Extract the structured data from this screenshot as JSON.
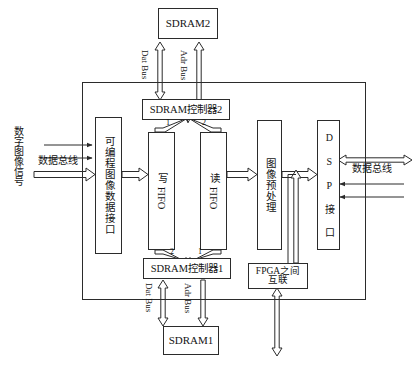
{
  "diagram": {
    "boundary_name": "FPGA",
    "external_blocks": [
      {
        "id": "sdram2",
        "label": "SDRAM2"
      },
      {
        "id": "sdram1",
        "label": "SDRAM1"
      }
    ],
    "internal_blocks": [
      {
        "id": "ctrl2",
        "label": "SDRAM控制器2"
      },
      {
        "id": "ctrl1",
        "label": "SDRAM控制器1"
      },
      {
        "id": "img_iface",
        "label": "可编程图像数据接口"
      },
      {
        "id": "write_fifo",
        "label": "写 FIFO"
      },
      {
        "id": "read_fifo",
        "label": "读 FIFO"
      },
      {
        "id": "preproc",
        "label": "图像预处理"
      },
      {
        "id": "dsp_iface",
        "label": "D S P 接 口"
      },
      {
        "id": "fpga_link",
        "label_line1": "FPGA之间",
        "label_line2": "互联"
      }
    ],
    "bus_labels": {
      "dat_bus_top": "Dat Bus",
      "adr_bus_top": "Adr Bus",
      "dat_bus_bottom": "Dat Bus",
      "adr_bus_bottom": "Adr Bus",
      "data_bus_left": "数据总线",
      "data_bus_right": "数据总线"
    },
    "signal_labels": {
      "digital_image_signal": "数字图像信号"
    },
    "channel_numbers": {
      "ctrl2_to_write_fifo": "1",
      "ctrl2_to_read_fifo": "2",
      "write_fifo_to_ctrl1": "2",
      "read_fifo_to_ctrl1": "1"
    },
    "colors": {
      "line": "#2b2b2b",
      "text": "#141414",
      "background": "#ffffff"
    }
  }
}
